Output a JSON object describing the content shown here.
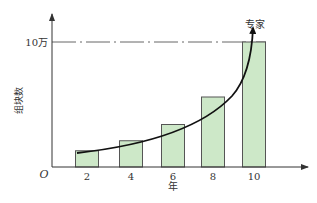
{
  "chart_data": {
    "type": "bar",
    "title": "",
    "xlabel": "年",
    "ylabel": "组块数",
    "origin_label": "O",
    "categories": [
      "2",
      "4",
      "6",
      "8",
      "10"
    ],
    "values": [
      13000,
      21000,
      34000,
      56000,
      100000
    ],
    "y_reference_line": {
      "label": "10万",
      "value": 100000,
      "style": "dash-dot"
    },
    "curve": {
      "type": "exponential-trend",
      "arrow_label": "专家"
    },
    "ylim": [
      0,
      120000
    ],
    "grid": false,
    "legend": null,
    "colors": {
      "bar_fill": "#cde8c8",
      "bar_stroke": "#555555",
      "axis": "#333333",
      "curve": "#111111"
    }
  }
}
